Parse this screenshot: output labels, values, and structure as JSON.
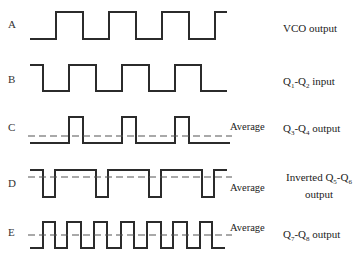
{
  "diagram": {
    "rows": [
      {
        "id": "A",
        "letter": "A",
        "label": "VCO output",
        "has_average": false,
        "top": 12,
        "bottom": 39,
        "transitions": [
          30,
          56,
          83,
          109,
          136,
          162,
          189,
          215,
          227
        ],
        "start_level": "low"
      },
      {
        "id": "B",
        "letter": "B",
        "label_prefix": "Q",
        "sub1": "1",
        "mid": "-Q",
        "sub2": "2",
        "label_suffix": " input",
        "label": "Q1-Q2 input",
        "has_average": false,
        "top": 65,
        "bottom": 91,
        "transitions": [
          30,
          43,
          69,
          96,
          122,
          149,
          175,
          201,
          227
        ],
        "start_level": "high"
      },
      {
        "id": "C",
        "letter": "C",
        "label": "Q3-Q4 output",
        "has_average": true,
        "average_label": "Average",
        "average_y": 136,
        "top": 117,
        "bottom": 143,
        "transitions": [
          30,
          69,
          83,
          122,
          136,
          175,
          189,
          230
        ],
        "start_level": "low"
      },
      {
        "id": "D",
        "letter": "D",
        "label": "Inverted Q5-Q6 output",
        "label_line1": "Inverted Q5-Q6",
        "label_line2": "output",
        "has_average": true,
        "average_label": "Average",
        "average_y": 177,
        "top": 170,
        "bottom": 197,
        "transitions": [
          30,
          43,
          55,
          96,
          108,
          149,
          161,
          202,
          214,
          227
        ],
        "start_level": "high"
      },
      {
        "id": "E",
        "letter": "E",
        "label": "Q7-Q8 output",
        "has_average": true,
        "average_label": "Average",
        "average_y": 235,
        "top": 222,
        "bottom": 248,
        "transitions": [
          30,
          43,
          55,
          67,
          81,
          94,
          107,
          121,
          134,
          147,
          161,
          173,
          187,
          200,
          212,
          225
        ],
        "start_level": "low"
      }
    ],
    "labels": {
      "A": "VCO output",
      "B": "Q1-Q2 input",
      "C": "Q3-Q4 output",
      "D_line1": "Inverted Q5-Q6",
      "D_line2": "output",
      "E": "Q7-Q8 output",
      "average": "Average"
    },
    "letters": {
      "A": "A",
      "B": "B",
      "C": "C",
      "D": "D",
      "E": "E"
    },
    "colors": {
      "line": "#2b2b2b",
      "background": "#ffffff"
    }
  }
}
